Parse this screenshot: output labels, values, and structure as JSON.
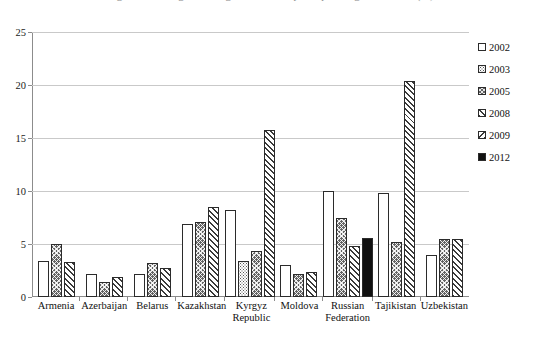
{
  "title": {
    "text": "Figure 3: Average annual growth rate of per capita original income (%)",
    "visible_note": "clipped at top edge"
  },
  "chart_data": {
    "type": "bar",
    "title": "Figure 3: Average annual growth rate of per capita original income (%)",
    "xlabel": "",
    "ylabel": "",
    "ylim": [
      0,
      25
    ],
    "yticks": [
      0,
      5,
      10,
      15,
      20,
      25
    ],
    "ytick_labels": [
      "0",
      "5",
      "10",
      "15",
      "20",
      "25"
    ],
    "grid": true,
    "legend_position": "right",
    "categories": [
      "Armenia",
      "Azerbaijan",
      "Belarus",
      "Kazakhstan",
      "Kyrgyz Republic",
      "Moldova",
      "Russian Federation",
      "Tajikistan",
      "Uzbekistan"
    ],
    "series": [
      {
        "name": "2002",
        "pattern": "none",
        "values": [
          3.4,
          2.2,
          2.2,
          6.9,
          8.2,
          3.0,
          10.0,
          9.8,
          4.0
        ]
      },
      {
        "name": "2003",
        "pattern": "dots",
        "values": [
          null,
          null,
          null,
          null,
          3.4,
          null,
          null,
          null,
          null
        ]
      },
      {
        "name": "2005",
        "pattern": "cross",
        "values": [
          5.0,
          1.4,
          3.2,
          7.1,
          4.3,
          2.2,
          7.5,
          5.2,
          5.5
        ]
      },
      {
        "name": "2008",
        "pattern": "diag-f",
        "values": [
          3.3,
          1.9,
          2.7,
          8.5,
          15.8,
          2.4,
          4.8,
          20.4,
          5.5
        ]
      },
      {
        "name": "2009",
        "pattern": "diag-b",
        "values": [
          null,
          null,
          null,
          null,
          null,
          null,
          null,
          null,
          null
        ]
      },
      {
        "name": "2012",
        "pattern": "solid",
        "values": [
          null,
          null,
          null,
          null,
          null,
          null,
          5.6,
          null,
          null
        ]
      }
    ]
  },
  "legend": {
    "items": [
      {
        "label": "2002",
        "pattern": "none"
      },
      {
        "label": "2003",
        "pattern": "dots"
      },
      {
        "label": "2005",
        "pattern": "cross"
      },
      {
        "label": "2008",
        "pattern": "diag-f"
      },
      {
        "label": "2009",
        "pattern": "diag-b"
      },
      {
        "label": "2012",
        "pattern": "solid"
      }
    ]
  },
  "axis": {
    "y_labels": [
      "25",
      "20",
      "15",
      "10",
      "5",
      "0"
    ]
  },
  "xaxis": {
    "labels": [
      {
        "l1": "Armenia",
        "l2": ""
      },
      {
        "l1": "Azerbaijan",
        "l2": ""
      },
      {
        "l1": "Belarus",
        "l2": ""
      },
      {
        "l1": "Kazakhstan",
        "l2": ""
      },
      {
        "l1": "Kyrgyz",
        "l2": "Republic"
      },
      {
        "l1": "Moldova",
        "l2": ""
      },
      {
        "l1": "Russian",
        "l2": "Federation"
      },
      {
        "l1": "Tajikistan",
        "l2": ""
      },
      {
        "l1": "Uzbekistan",
        "l2": ""
      }
    ]
  },
  "colors": {
    "axis": "#8c8c8c",
    "grid": "#c9c9c9",
    "bar_outline": "#2b2b2b",
    "text": "#111111"
  }
}
